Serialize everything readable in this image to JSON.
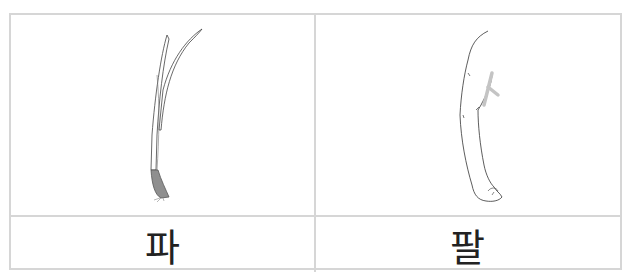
{
  "cards": [
    {
      "image": "green-onion-illustration",
      "word": "파",
      "meaning": "green onion"
    },
    {
      "image": "arm-illustration",
      "word": "팔",
      "meaning": "arm"
    }
  ],
  "colors": {
    "border": "#d6d6d6",
    "text": "#222222",
    "onion_root": "#8f8f8f"
  }
}
